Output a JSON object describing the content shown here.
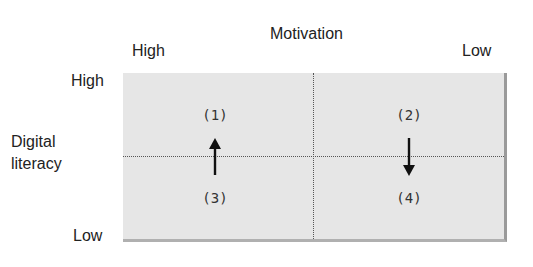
{
  "x_axis": {
    "title": "Motivation",
    "left_label": "High",
    "right_label": "Low"
  },
  "y_axis": {
    "title_line1": "Digital",
    "title_line2": "literacy",
    "top_label": "High",
    "bottom_label": "Low"
  },
  "quadrants": [
    {
      "label": "(1)"
    },
    {
      "label": "(2)"
    },
    {
      "label": "(3)"
    },
    {
      "label": "(4)"
    }
  ],
  "arrows": [
    {
      "from": "(3)",
      "to": "(1)",
      "direction": "up"
    },
    {
      "from": "(2)",
      "to": "(4)",
      "direction": "down"
    }
  ],
  "colors": {
    "fill": "#e6e6e6",
    "border": "#9a9a9a",
    "text": "#222222"
  }
}
